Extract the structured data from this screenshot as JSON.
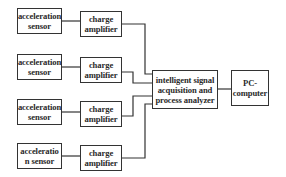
{
  "diagram": {
    "type": "block-diagram",
    "colors": {
      "line": "#333333",
      "background": "#ffffff",
      "text": "#2a2a2a"
    },
    "sensors": [
      {
        "label": "acceleration\nsensor"
      },
      {
        "label": "acceleration\nsensor"
      },
      {
        "label": "acceleration\nsensor"
      },
      {
        "label": "acceleratio\nn sensor"
      }
    ],
    "amplifiers": [
      {
        "label": "charge\namplifier"
      },
      {
        "label": "charge\namplifier"
      },
      {
        "label": "charge\namplifier"
      },
      {
        "label": "charge\namplifier"
      }
    ],
    "analyzer": {
      "label": "intelligent signal\nacquisition and\nprocess analyzer"
    },
    "computer": {
      "label": "PC-\ncomputer"
    },
    "connections": [
      [
        "sensor-1",
        "amplifier-1"
      ],
      [
        "sensor-2",
        "amplifier-2"
      ],
      [
        "sensor-3",
        "amplifier-3"
      ],
      [
        "sensor-4",
        "amplifier-4"
      ],
      [
        "amplifier-1",
        "analyzer"
      ],
      [
        "amplifier-2",
        "analyzer"
      ],
      [
        "amplifier-3",
        "analyzer"
      ],
      [
        "amplifier-4",
        "analyzer"
      ],
      [
        "analyzer",
        "computer"
      ]
    ]
  }
}
